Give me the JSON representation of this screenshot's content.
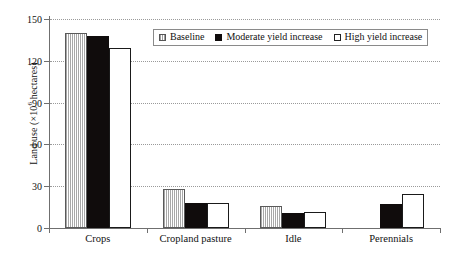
{
  "chart_data": {
    "type": "bar",
    "title": "",
    "xlabel": "",
    "ylabel_text": "Land use (×10",
    "ylabel_sup": "6",
    "ylabel_tail": " hectares)",
    "ylabel_full": "Land use (×10^6 hectares)",
    "categories": [
      "Crops",
      "Cropland pasture",
      "Idle",
      "Perennials"
    ],
    "series": [
      {
        "name": "Baseline",
        "key": "baseline",
        "color": "#a8a8a8",
        "fill": "vertical-stripes",
        "values": [
          140,
          28,
          15.5,
          0
        ]
      },
      {
        "name": "Moderate yield increase",
        "key": "moderate",
        "color": "#100c0c",
        "fill": "solid-black",
        "values": [
          138,
          18,
          11,
          17
        ]
      },
      {
        "name": "High yield increase",
        "key": "high",
        "color": "#ffffff",
        "fill": "white-outline",
        "values": [
          129,
          18,
          11.5,
          24.5
        ]
      }
    ],
    "ylim": [
      0,
      150
    ],
    "yticks": [
      0,
      30,
      60,
      90,
      120,
      150
    ],
    "ytick_labels": [
      "0",
      "30",
      "60",
      "90",
      "120",
      "150"
    ],
    "grid": "horizontal-dotted",
    "legend_position": "top-center-inside",
    "axis_color": "#6f6f6f",
    "grid_color": "#9a9a9a"
  }
}
